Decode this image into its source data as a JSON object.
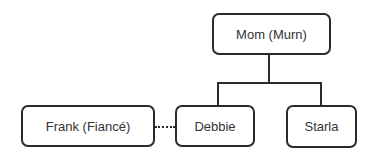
{
  "diagram": {
    "type": "family-tree",
    "nodes": {
      "mom": {
        "label": "Mom (Murn)"
      },
      "frank": {
        "label": "Frank (Fiancé)"
      },
      "debbie": {
        "label": "Debbie"
      },
      "starla": {
        "label": "Starla"
      }
    },
    "edges": [
      {
        "from": "mom",
        "to": "debbie",
        "style": "solid",
        "relation": "parent-child"
      },
      {
        "from": "mom",
        "to": "starla",
        "style": "solid",
        "relation": "parent-child"
      },
      {
        "from": "frank",
        "to": "debbie",
        "style": "dotted",
        "relation": "engaged"
      }
    ],
    "colors": {
      "stroke": "#2b2b2b",
      "text": "#333333",
      "background": "#ffffff"
    }
  }
}
